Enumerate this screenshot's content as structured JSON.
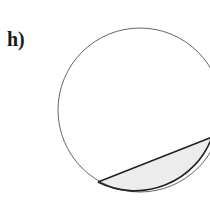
{
  "figure": {
    "label": "h)",
    "shape": "circle",
    "shaded_region": "minor segment cut by chord",
    "colors": {
      "stroke": "#555555",
      "chord": "#222222",
      "fill": "#ececec"
    }
  }
}
